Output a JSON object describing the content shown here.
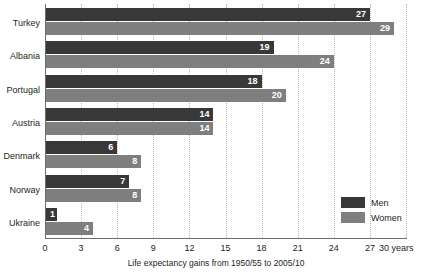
{
  "chart_data": {
    "type": "bar",
    "orientation": "horizontal",
    "title": "",
    "xlabel": "Life expectancy gains from 1950/55 to 2005/10",
    "ylabel": "",
    "xlim": [
      0,
      30
    ],
    "xticks": [
      0,
      3,
      6,
      9,
      12,
      15,
      18,
      21,
      24,
      27,
      30
    ],
    "xtick_labels": [
      "0",
      "3",
      "6",
      "9",
      "12",
      "15",
      "18",
      "21",
      "24",
      "27",
      "30 years"
    ],
    "grid": true,
    "grid_axis": "x",
    "legend_position": "inside-bottom-right",
    "categories": [
      "Turkey",
      "Albania",
      "Portugal",
      "Austria",
      "Denmark",
      "Norway",
      "Ukraine"
    ],
    "series": [
      {
        "name": "Men",
        "color": "#383838",
        "values": [
          27,
          19,
          18,
          14,
          6,
          7,
          1
        ]
      },
      {
        "name": "Women",
        "color": "#7f7f7f",
        "values": [
          29,
          24,
          20,
          14,
          8,
          8,
          4
        ]
      }
    ]
  },
  "axis": {
    "unit_suffix": "years"
  },
  "legend": {
    "items": [
      {
        "label": "Men",
        "color": "#383838"
      },
      {
        "label": "Women",
        "color": "#7f7f7f"
      }
    ]
  }
}
